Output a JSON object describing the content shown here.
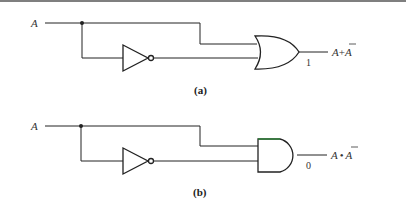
{
  "diagrams": [
    {
      "caption": "(a)",
      "input_label": "A",
      "gate_type": "OR",
      "output_value": "1",
      "output_expression": {
        "lhs": "A",
        "op": "+",
        "rhs": "A"
      }
    },
    {
      "caption": "(b)",
      "input_label": "A",
      "gate_type": "AND",
      "output_value": "0",
      "output_expression": {
        "lhs": "A",
        "op": "•",
        "rhs": "A"
      }
    }
  ],
  "colors": {
    "line": "#222222",
    "and_gate_top_edge": "#2e8b3a",
    "top_rule": "#555555"
  }
}
